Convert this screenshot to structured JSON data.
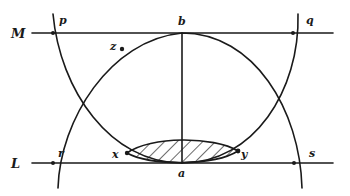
{
  "diagram": {
    "width": 350,
    "height": 196,
    "colors": {
      "ink": "#1a1a1a",
      "background": "#ffffff"
    },
    "lines": {
      "M": {
        "label": "M",
        "x1": 32,
        "x2": 333,
        "y": 33
      },
      "L": {
        "label": "L",
        "x1": 32,
        "x2": 333,
        "y": 163
      },
      "ba": {
        "x": 182,
        "y1": 33,
        "y2": 163
      }
    },
    "points": {
      "p": {
        "label": "p",
        "x": 53,
        "y": 33
      },
      "q": {
        "label": "q",
        "x": 293,
        "y": 33
      },
      "b": {
        "label": "b",
        "x": 182,
        "y": 33
      },
      "z": {
        "label": "z",
        "x": 122,
        "y": 49
      },
      "r": {
        "label": "r",
        "x": 53,
        "y": 163
      },
      "s": {
        "label": "s",
        "x": 294,
        "y": 163
      },
      "x": {
        "label": "x",
        "x": 127,
        "y": 153
      },
      "y": {
        "label": "y",
        "x": 238,
        "y": 151
      },
      "a": {
        "label": "a",
        "x": 182,
        "y": 163
      }
    },
    "curves": {
      "upper_arc": "M 58 188 C 60 120, 110 40, 182 33 C 254 33, 300 110, 302 188",
      "lower_arc": "M 53 14 C 60 90, 110 163, 182 163 C 254 163, 300 90, 298 14",
      "left_outer_arc": "M 54 15 C 46 70, 46 130, 58 188",
      "right_outer_arc": "M 296 15 C 304 70, 304 130, 291 188",
      "lens_top": "M 127 153 C 150 136, 214 136, 238 151",
      "lens_bottom": "M 127 153 C 150 166, 214 166, 238 151"
    },
    "shaded_region": {
      "name": "lens x-y",
      "pattern": "diagonal hatching"
    }
  }
}
